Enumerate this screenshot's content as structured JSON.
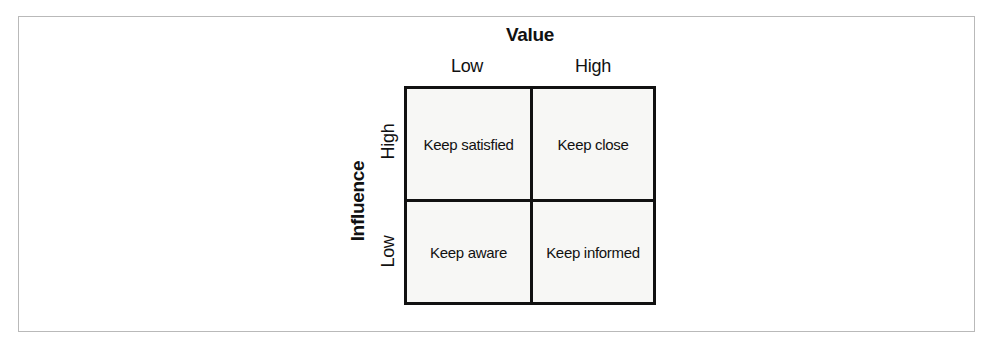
{
  "figure": {
    "x_axis": {
      "title": "Value",
      "ticks": [
        "Low",
        "High"
      ]
    },
    "y_axis": {
      "title": "Influence",
      "ticks": [
        "High",
        "Low"
      ]
    },
    "cells": [
      {
        "label": "Keep satisfied",
        "value": "Low",
        "influence": "High"
      },
      {
        "label": "Keep close",
        "value": "High",
        "influence": "High"
      },
      {
        "label": "Keep aware",
        "value": "Low",
        "influence": "Low"
      },
      {
        "label": "Keep informed",
        "value": "High",
        "influence": "Low"
      }
    ],
    "colors": {
      "grid_line": "#111111",
      "cell_background": "#f7f7f5",
      "page_border": "#b9b9b9",
      "text": "#111111"
    }
  },
  "chart_data": {
    "type": "table",
    "title": "Value",
    "xlabel": "Value",
    "ylabel": "Influence",
    "columns": [
      "Low",
      "High"
    ],
    "rows": [
      "High",
      "Low"
    ],
    "values": [
      [
        "Keep satisfied",
        "Keep close"
      ],
      [
        "Keep aware",
        "Keep informed"
      ]
    ],
    "grid": true,
    "legend": "none"
  }
}
